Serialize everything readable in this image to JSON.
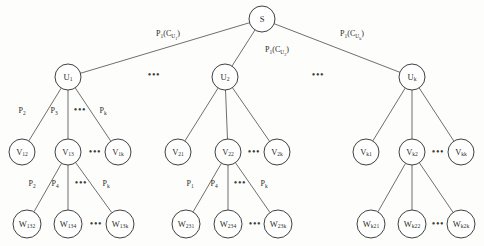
{
  "diagram": {
    "background_color": "#fdfdfb",
    "node_fill": "#ffffff",
    "node_stroke": "#2b2b2b",
    "edge_stroke": "#4a4a4a",
    "ellipsis_glyph": "•••",
    "levels": [
      {
        "name": "root",
        "nodes": [
          {
            "id": "S",
            "base": "S",
            "sub": "",
            "cx": 262,
            "cy": 19,
            "r": 13
          }
        ]
      },
      {
        "name": "u-level",
        "nodes": [
          {
            "id": "U1",
            "base": "U",
            "sub": "1",
            "cx": 68,
            "cy": 77,
            "r": 13
          },
          {
            "id": "U2",
            "base": "U",
            "sub": "2",
            "cx": 225,
            "cy": 77,
            "r": 13
          },
          {
            "id": "Uk",
            "base": "U",
            "sub": "k",
            "cx": 412,
            "cy": 77,
            "r": 13
          }
        ]
      },
      {
        "name": "v-level",
        "nodes": [
          {
            "id": "V12",
            "base": "V",
            "sub": "12",
            "cx": 22,
            "cy": 152,
            "r": 13
          },
          {
            "id": "V13",
            "base": "V",
            "sub": "13",
            "cx": 68,
            "cy": 152,
            "r": 13
          },
          {
            "id": "V1k",
            "base": "V",
            "sub": "1k",
            "cx": 118,
            "cy": 152,
            "r": 13
          },
          {
            "id": "V21",
            "base": "V",
            "sub": "21",
            "cx": 178,
            "cy": 152,
            "r": 13
          },
          {
            "id": "V22",
            "base": "V",
            "sub": "22",
            "cx": 228,
            "cy": 152,
            "r": 13
          },
          {
            "id": "V2k",
            "base": "V",
            "sub": "2k",
            "cx": 277,
            "cy": 152,
            "r": 13
          },
          {
            "id": "Vk1",
            "base": "V",
            "sub": "k1",
            "cx": 366,
            "cy": 152,
            "r": 13
          },
          {
            "id": "Vk2",
            "base": "V",
            "sub": "k2",
            "cx": 412,
            "cy": 152,
            "r": 13
          },
          {
            "id": "Vkk",
            "base": "V",
            "sub": "kk",
            "cx": 461,
            "cy": 152,
            "r": 13
          }
        ]
      },
      {
        "name": "w-level",
        "nodes": [
          {
            "id": "W132",
            "base": "W",
            "sub": "132",
            "cx": 27,
            "cy": 224,
            "r": 14
          },
          {
            "id": "W134",
            "base": "W",
            "sub": "134",
            "cx": 68,
            "cy": 224,
            "r": 14
          },
          {
            "id": "W13k",
            "base": "W",
            "sub": "13k",
            "cx": 120,
            "cy": 224,
            "r": 14
          },
          {
            "id": "W231",
            "base": "W",
            "sub": "231",
            "cx": 186,
            "cy": 224,
            "r": 14
          },
          {
            "id": "W234",
            "base": "W",
            "sub": "234",
            "cx": 228,
            "cy": 224,
            "r": 14
          },
          {
            "id": "W23k",
            "base": "W",
            "sub": "23k",
            "cx": 278,
            "cy": 224,
            "r": 14
          },
          {
            "id": "Wk21",
            "base": "W",
            "sub": "k21",
            "cx": 371,
            "cy": 224,
            "r": 14
          },
          {
            "id": "Wk22",
            "base": "W",
            "sub": "k22",
            "cx": 412,
            "cy": 224,
            "r": 14
          },
          {
            "id": "Wk2k",
            "base": "W",
            "sub": "k2k",
            "cx": 461,
            "cy": 224,
            "r": 14
          }
        ]
      }
    ],
    "edges": [
      {
        "from": "S",
        "to": "U1"
      },
      {
        "from": "S",
        "to": "U2"
      },
      {
        "from": "S",
        "to": "Uk"
      },
      {
        "from": "U1",
        "to": "V12"
      },
      {
        "from": "U1",
        "to": "V13"
      },
      {
        "from": "U1",
        "to": "V1k"
      },
      {
        "from": "U2",
        "to": "V21"
      },
      {
        "from": "U2",
        "to": "V22"
      },
      {
        "from": "U2",
        "to": "V2k"
      },
      {
        "from": "Uk",
        "to": "Vk1"
      },
      {
        "from": "Uk",
        "to": "Vk2"
      },
      {
        "from": "Uk",
        "to": "Vkk"
      },
      {
        "from": "V13",
        "to": "W132"
      },
      {
        "from": "V13",
        "to": "W134"
      },
      {
        "from": "V13",
        "to": "W13k"
      },
      {
        "from": "V22",
        "to": "W231"
      },
      {
        "from": "V22",
        "to": "W234"
      },
      {
        "from": "V22",
        "to": "W23k"
      },
      {
        "from": "Vk2",
        "to": "Wk21"
      },
      {
        "from": "Vk2",
        "to": "Wk22"
      },
      {
        "from": "Vk2",
        "to": "Wk2k"
      }
    ],
    "edge_labels": [
      {
        "id": "lbl-s-u1",
        "base": "P",
        "sub": "1",
        "paren_open": "(C",
        "paren_sub": "U",
        "paren_sub2": "1",
        "paren_close": ")",
        "x": 168,
        "y": 36
      },
      {
        "id": "lbl-s-u2",
        "base": "P",
        "sub": "1",
        "paren_open": "(C",
        "paren_sub": "U",
        "paren_sub2": "2",
        "paren_close": ")",
        "x": 277,
        "y": 52
      },
      {
        "id": "lbl-s-uk",
        "base": "P",
        "sub": "1",
        "paren_open": "(C",
        "paren_sub": "U",
        "paren_sub2": "k",
        "paren_close": ")",
        "x": 352,
        "y": 36
      },
      {
        "id": "lbl-u1-v12",
        "base": "P",
        "sub": "2",
        "x": 22,
        "y": 113
      },
      {
        "id": "lbl-u1-v13",
        "base": "P",
        "sub": "3",
        "x": 54,
        "y": 113
      },
      {
        "id": "lbl-u1-v1k",
        "base": "P",
        "sub": "k",
        "x": 103,
        "y": 113
      },
      {
        "id": "lbl-v13-w132",
        "base": "P",
        "sub": "2",
        "x": 32,
        "y": 186
      },
      {
        "id": "lbl-v13-w134",
        "base": "P",
        "sub": "4",
        "x": 55,
        "y": 186
      },
      {
        "id": "lbl-v13-w13k",
        "base": "P",
        "sub": "k",
        "x": 106,
        "y": 186
      },
      {
        "id": "lbl-v22-w231",
        "base": "P",
        "sub": "1",
        "x": 190,
        "y": 186
      },
      {
        "id": "lbl-v22-w234",
        "base": "P",
        "sub": "4",
        "x": 214,
        "y": 186
      },
      {
        "id": "lbl-v22-w23k",
        "base": "P",
        "sub": "k",
        "x": 264,
        "y": 186
      }
    ],
    "ellipses": [
      {
        "id": "ell-u-left",
        "x": 154,
        "y": 78
      },
      {
        "id": "ell-u-right",
        "x": 318,
        "y": 78
      },
      {
        "id": "ell-v1",
        "x": 95,
        "y": 155
      },
      {
        "id": "ell-v2",
        "x": 254,
        "y": 155
      },
      {
        "id": "ell-vk",
        "x": 438,
        "y": 155
      },
      {
        "id": "ell-w13",
        "x": 96,
        "y": 227
      },
      {
        "id": "ell-w23",
        "x": 255,
        "y": 227
      },
      {
        "id": "ell-wk2",
        "x": 438,
        "y": 227
      },
      {
        "id": "ell-u1-child",
        "x": 80,
        "y": 113
      },
      {
        "id": "ell-v13-child",
        "x": 81,
        "y": 186
      },
      {
        "id": "ell-v22-child",
        "x": 240,
        "y": 186
      }
    ]
  }
}
